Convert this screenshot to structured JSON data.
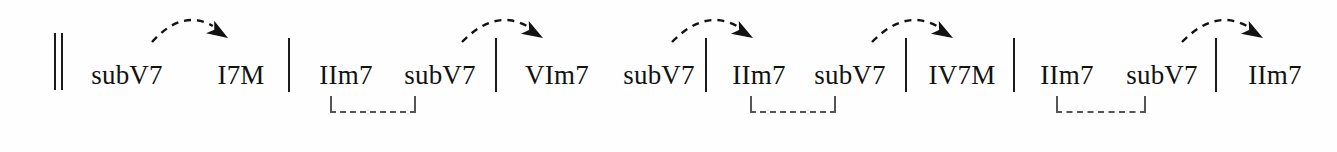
{
  "document": {
    "type": "chord-progression-diagram",
    "description": "Jazz harmony chord progression showing tritone substitution (subV7) resolutions and ii-V groupings",
    "background_color": "#fefefe",
    "ink_color": "#121212",
    "bracket_color": "#555555",
    "width": 1337,
    "height": 152
  },
  "staff": {
    "opening_double_barline": {
      "x": 54,
      "y": 33,
      "height": 57
    },
    "barlines": [
      {
        "name": "barline-1",
        "x": 288,
        "y": 38,
        "height": 54
      },
      {
        "name": "barline-2",
        "x": 495,
        "y": 38,
        "height": 54
      },
      {
        "name": "barline-3",
        "x": 705,
        "y": 38,
        "height": 54
      },
      {
        "name": "barline-4",
        "x": 905,
        "y": 38,
        "height": 54
      },
      {
        "name": "barline-5",
        "x": 1013,
        "y": 38,
        "height": 54
      },
      {
        "name": "barline-6",
        "x": 1215,
        "y": 38,
        "height": 54
      }
    ]
  },
  "measures": [
    {
      "index": 1,
      "chords": [
        {
          "label": "subV7",
          "x": 127,
          "y": 76
        },
        {
          "label": "I7M",
          "x": 241,
          "y": 76
        }
      ]
    },
    {
      "index": 2,
      "chords": [
        {
          "label": "IIm7",
          "x": 346,
          "y": 76
        },
        {
          "label": "subV7",
          "x": 440,
          "y": 76
        }
      ]
    },
    {
      "index": 3,
      "chords": [
        {
          "label": "VIm7",
          "x": 557,
          "y": 76
        },
        {
          "label": "subV7",
          "x": 659,
          "y": 76
        }
      ]
    },
    {
      "index": 4,
      "chords": [
        {
          "label": "IIm7",
          "x": 759,
          "y": 76
        },
        {
          "label": "subV7",
          "x": 850,
          "y": 76
        }
      ]
    },
    {
      "index": 5,
      "chords": [
        {
          "label": "IV7M",
          "x": 962,
          "y": 76
        }
      ]
    },
    {
      "index": 6,
      "chords": [
        {
          "label": "IIm7",
          "x": 1067,
          "y": 76
        },
        {
          "label": "subV7",
          "x": 1162,
          "y": 76
        }
      ]
    },
    {
      "index": 7,
      "chords": [
        {
          "label": "IIm7",
          "x": 1275,
          "y": 76
        }
      ]
    }
  ],
  "resolution_arrows": [
    {
      "name": "resolution-arrow-1",
      "from_chord": "subV7",
      "to_chord": "I7M",
      "start_x": 152,
      "peak_x": 190,
      "end_x": 228,
      "start_y": 42,
      "peak_y": 20,
      "end_y": 38
    },
    {
      "name": "resolution-arrow-2",
      "from_chord": "subV7",
      "to_chord": "VIm7",
      "start_x": 462,
      "peak_x": 503,
      "end_x": 543,
      "start_y": 42,
      "peak_y": 20,
      "end_y": 38
    },
    {
      "name": "resolution-arrow-3",
      "from_chord": "subV7",
      "to_chord": "IIm7",
      "start_x": 672,
      "peak_x": 713,
      "end_x": 753,
      "start_y": 42,
      "peak_y": 20,
      "end_y": 38
    },
    {
      "name": "resolution-arrow-4",
      "from_chord": "subV7",
      "to_chord": "IV7M",
      "start_x": 872,
      "peak_x": 913,
      "end_x": 953,
      "start_y": 42,
      "peak_y": 20,
      "end_y": 38
    },
    {
      "name": "resolution-arrow-5",
      "from_chord": "subV7",
      "to_chord": "IIm7",
      "start_x": 1182,
      "peak_x": 1223,
      "end_x": 1263,
      "start_y": 42,
      "peak_y": 20,
      "end_y": 38
    }
  ],
  "grouping_brackets": [
    {
      "name": "grouping-bracket-1",
      "groups": [
        "IIm7",
        "subV7"
      ],
      "x": 330,
      "y": 96,
      "width": 86,
      "height": 17
    },
    {
      "name": "grouping-bracket-2",
      "groups": [
        "IIm7",
        "subV7"
      ],
      "x": 750,
      "y": 96,
      "width": 86,
      "height": 17
    },
    {
      "name": "grouping-bracket-3",
      "groups": [
        "IIm7",
        "subV7"
      ],
      "x": 1056,
      "y": 96,
      "width": 90,
      "height": 17
    }
  ]
}
